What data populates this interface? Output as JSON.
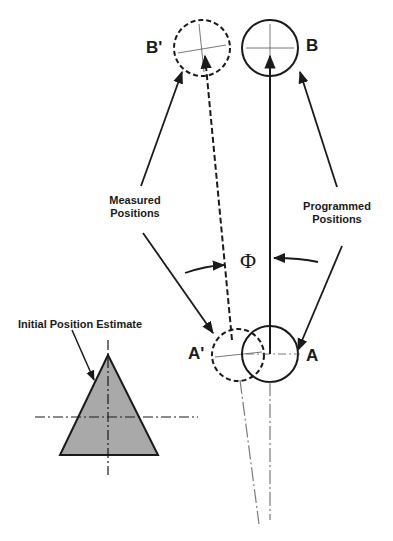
{
  "diagram": {
    "labels": {
      "b_prime": "B'",
      "b": "B",
      "a_prime": "A'",
      "a": "A",
      "phi": "Φ",
      "measured_line1": "Measured",
      "measured_line2": "Positions",
      "programmed_line1": "Programmed",
      "programmed_line2": "Positions",
      "initial_estimate": "Initial Position Estimate"
    },
    "colors": {
      "stroke": "#1a1a1a",
      "triangle_fill": "#a9a9a9",
      "centerline": "#7a7a7a",
      "background": "#ffffff"
    }
  }
}
